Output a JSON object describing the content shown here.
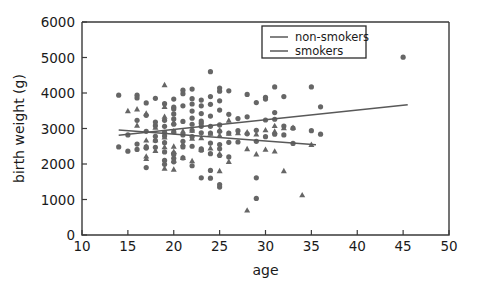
{
  "chart_data": {
    "type": "scatter",
    "title": "",
    "xlabel": "age",
    "ylabel": "birth weight (g)",
    "xlim": [
      10,
      50
    ],
    "ylim": [
      0,
      6000
    ],
    "xticks": [
      10,
      15,
      20,
      25,
      30,
      35,
      40,
      45,
      50
    ],
    "yticks": [
      0,
      1000,
      2000,
      3000,
      4000,
      5000,
      6000
    ],
    "grid": false,
    "legend_position": "upper right",
    "marker_color": "#666666",
    "line_color": "#595959",
    "background_color": "#ffffff",
    "series": [
      {
        "name": "non-smokers",
        "marker": "circle",
        "points": [
          [
            14,
            2480
          ],
          [
            14,
            3940
          ],
          [
            15,
            2360
          ],
          [
            15,
            2820
          ],
          [
            16,
            2410
          ],
          [
            16,
            3940
          ],
          [
            16,
            3860
          ],
          [
            16,
            2560
          ],
          [
            16,
            3230
          ],
          [
            17,
            1900
          ],
          [
            17,
            2920
          ],
          [
            17,
            3370
          ],
          [
            17,
            2450
          ],
          [
            17,
            2480
          ],
          [
            17,
            3720
          ],
          [
            18,
            3080
          ],
          [
            18,
            2780
          ],
          [
            18,
            3850
          ],
          [
            18,
            2660
          ],
          [
            18,
            2470
          ],
          [
            18,
            3180
          ],
          [
            19,
            3060
          ],
          [
            19,
            2790
          ],
          [
            19,
            2340
          ],
          [
            19,
            2100
          ],
          [
            19,
            3230
          ],
          [
            19,
            3700
          ],
          [
            19,
            2600
          ],
          [
            19,
            2890
          ],
          [
            19,
            1990
          ],
          [
            20,
            3830
          ],
          [
            20,
            3600
          ],
          [
            20,
            3270
          ],
          [
            20,
            3120
          ],
          [
            20,
            2910
          ],
          [
            20,
            2300
          ],
          [
            20,
            2160
          ],
          [
            20,
            2270
          ],
          [
            20,
            3410
          ],
          [
            20,
            2060
          ],
          [
            20,
            3550
          ],
          [
            21,
            4080
          ],
          [
            21,
            3640
          ],
          [
            21,
            3200
          ],
          [
            21,
            2820
          ],
          [
            21,
            2640
          ],
          [
            21,
            2480
          ],
          [
            21,
            3980
          ],
          [
            21,
            2170
          ],
          [
            22,
            4110
          ],
          [
            22,
            3840
          ],
          [
            22,
            3490
          ],
          [
            22,
            3290
          ],
          [
            22,
            3120
          ],
          [
            22,
            2950
          ],
          [
            22,
            2770
          ],
          [
            22,
            2500
          ],
          [
            22,
            1950
          ],
          [
            22,
            3690
          ],
          [
            23,
            3800
          ],
          [
            23,
            3640
          ],
          [
            23,
            3420
          ],
          [
            23,
            3210
          ],
          [
            23,
            3060
          ],
          [
            23,
            2880
          ],
          [
            23,
            2430
          ],
          [
            23,
            2390
          ],
          [
            23,
            1610
          ],
          [
            23,
            3150
          ],
          [
            24,
            4600
          ],
          [
            24,
            3900
          ],
          [
            24,
            3680
          ],
          [
            24,
            3350
          ],
          [
            24,
            3060
          ],
          [
            24,
            2870
          ],
          [
            24,
            2590
          ],
          [
            24,
            2290
          ],
          [
            24,
            1820
          ],
          [
            24,
            1600
          ],
          [
            25,
            4140
          ],
          [
            25,
            4050
          ],
          [
            25,
            3780
          ],
          [
            25,
            3520
          ],
          [
            25,
            3100
          ],
          [
            25,
            2920
          ],
          [
            25,
            2550
          ],
          [
            25,
            2430
          ],
          [
            25,
            2240
          ],
          [
            25,
            1420
          ],
          [
            25,
            1350
          ],
          [
            26,
            4060
          ],
          [
            26,
            3400
          ],
          [
            26,
            2870
          ],
          [
            26,
            2610
          ],
          [
            26,
            2200
          ],
          [
            27,
            3280
          ],
          [
            27,
            2940
          ],
          [
            27,
            2620
          ],
          [
            28,
            3960
          ],
          [
            28,
            3330
          ],
          [
            28,
            2850
          ],
          [
            29,
            3730
          ],
          [
            29,
            2950
          ],
          [
            29,
            2640
          ],
          [
            29,
            1610
          ],
          [
            29,
            1030
          ],
          [
            30,
            3880
          ],
          [
            30,
            3830
          ],
          [
            30,
            3240
          ],
          [
            30,
            2770
          ],
          [
            31,
            4170
          ],
          [
            31,
            3450
          ],
          [
            31,
            3260
          ],
          [
            31,
            2840
          ],
          [
            32,
            3900
          ],
          [
            32,
            3070
          ],
          [
            32,
            2820
          ],
          [
            33,
            3010
          ],
          [
            33,
            2580
          ],
          [
            35,
            4170
          ],
          [
            35,
            2940
          ],
          [
            36,
            3610
          ],
          [
            36,
            2840
          ],
          [
            45,
            5010
          ]
        ]
      },
      {
        "name": "smokers",
        "marker": "triangle",
        "points": [
          [
            15,
            3500
          ],
          [
            16,
            3550
          ],
          [
            16,
            3090
          ],
          [
            17,
            3430
          ],
          [
            17,
            2670
          ],
          [
            17,
            2500
          ],
          [
            17,
            2220
          ],
          [
            17,
            2150
          ],
          [
            18,
            3030
          ],
          [
            18,
            2680
          ],
          [
            18,
            2380
          ],
          [
            19,
            4230
          ],
          [
            19,
            3620
          ],
          [
            19,
            3340
          ],
          [
            19,
            2760
          ],
          [
            19,
            2480
          ],
          [
            19,
            1880
          ],
          [
            20,
            3180
          ],
          [
            20,
            2930
          ],
          [
            20,
            2500
          ],
          [
            20,
            2350
          ],
          [
            20,
            2100
          ],
          [
            20,
            1850
          ],
          [
            21,
            2930
          ],
          [
            21,
            2570
          ],
          [
            21,
            2180
          ],
          [
            22,
            2950
          ],
          [
            22,
            2720
          ],
          [
            22,
            2090
          ],
          [
            23,
            3110
          ],
          [
            23,
            2740
          ],
          [
            23,
            2410
          ],
          [
            24,
            2860
          ],
          [
            24,
            2450
          ],
          [
            25,
            2960
          ],
          [
            25,
            2810
          ],
          [
            25,
            2290
          ],
          [
            25,
            1810
          ],
          [
            26,
            3230
          ],
          [
            26,
            2860
          ],
          [
            26,
            2070
          ],
          [
            27,
            2880
          ],
          [
            28,
            2900
          ],
          [
            28,
            2430
          ],
          [
            28,
            700
          ],
          [
            29,
            2840
          ],
          [
            29,
            2280
          ],
          [
            30,
            2960
          ],
          [
            30,
            2410
          ],
          [
            31,
            3080
          ],
          [
            31,
            2920
          ],
          [
            31,
            2360
          ],
          [
            32,
            3020
          ],
          [
            32,
            1810
          ],
          [
            33,
            3030
          ],
          [
            34,
            1130
          ],
          [
            35,
            2550
          ]
        ]
      }
    ],
    "fit_lines": [
      {
        "name": "non-smokers",
        "x_start": 14,
        "y_start": 2810,
        "x_end": 45.5,
        "y_end": 3670
      },
      {
        "name": "smokers",
        "x_start": 14,
        "y_start": 2960,
        "x_end": 35.5,
        "y_end": 2540
      }
    ],
    "legend": [
      {
        "label": "non-smokers"
      },
      {
        "label": "smokers"
      }
    ]
  }
}
